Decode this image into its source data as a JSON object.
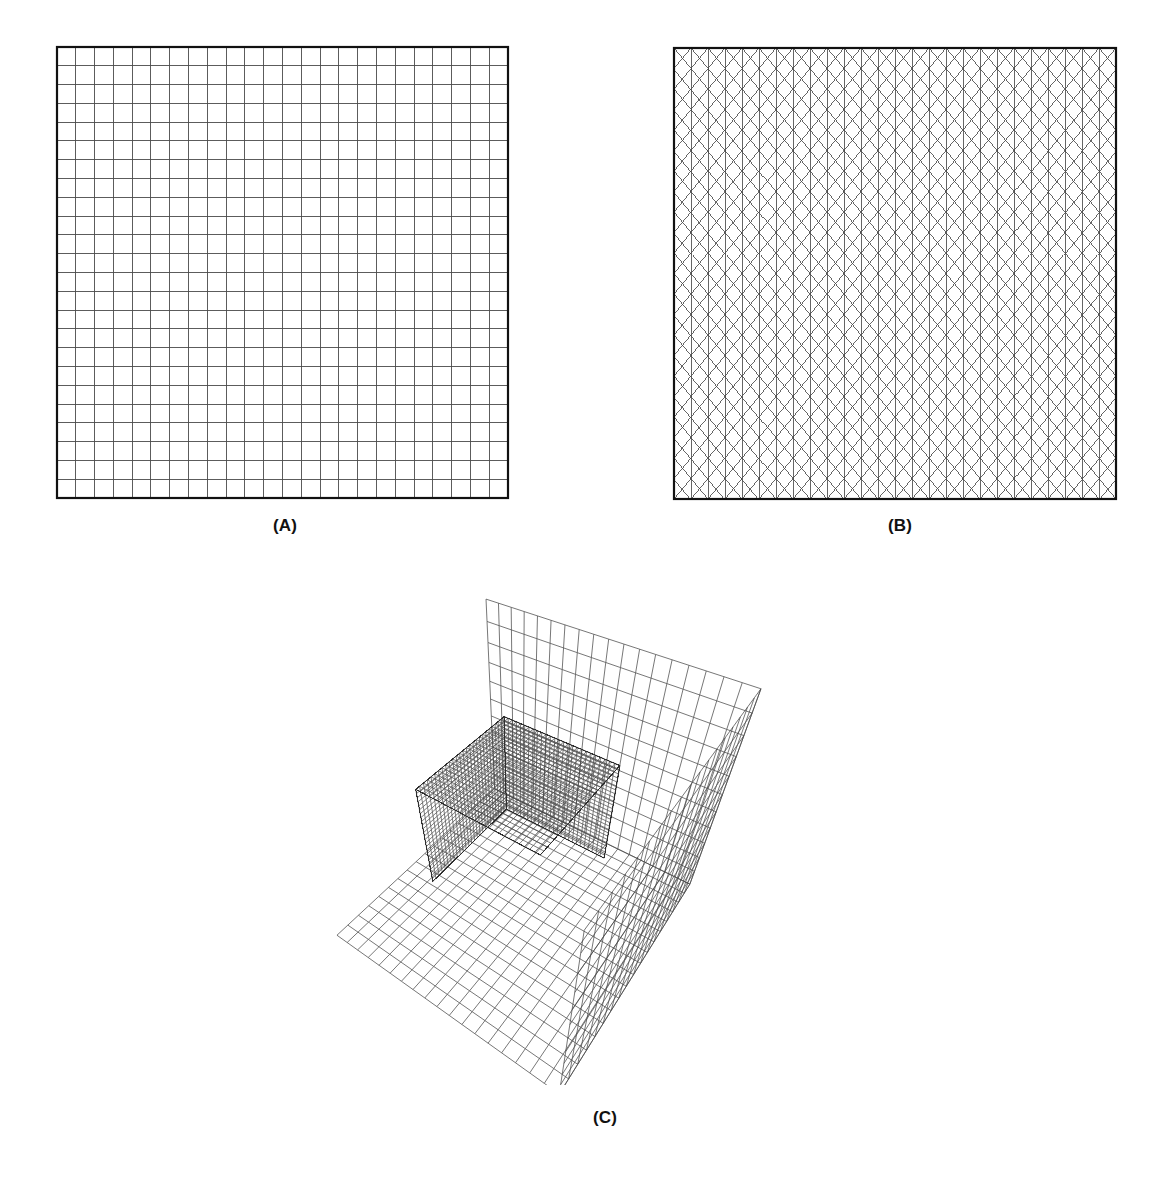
{
  "figure": {
    "background_color": "#ffffff",
    "line_color": "#4a4a4a",
    "border_color": "#111111",
    "caption_color": "#111111"
  },
  "panels": [
    {
      "id": "a",
      "caption": "(A)",
      "mesh_type": "structured-quadrilateral",
      "description": "Uniform structured quadrilateral (mapped) mesh on a square domain",
      "nx": 24,
      "ny": 24,
      "bounds": {
        "x": 55,
        "y": 45,
        "width": 455,
        "height": 455
      }
    },
    {
      "id": "b",
      "caption": "(B)",
      "mesh_type": "structured-triangular",
      "description": "Structured triangular mesh on a square domain formed by vertical lines and two crossing diagonal families",
      "nx": 26,
      "ny": 22,
      "bounds": {
        "x": 672,
        "y": 46,
        "width": 446,
        "height": 455
      }
    },
    {
      "id": "c",
      "caption": "(C)",
      "mesh_type": "hexahedral-3d",
      "description": "Three-dimensional hexahedral mesh: a finely meshed inner cube nested inside an outer box corner (back walls and floor)",
      "inner_divisions": 26,
      "outer_divisions": 18,
      "bounds": {
        "x": 180,
        "y": 580,
        "width": 680,
        "height": 505
      }
    }
  ],
  "chart_data": {
    "type": "diagram",
    "title": "",
    "subtitle": "",
    "panel_labels": [
      "(A)",
      "(B)",
      "(C)"
    ],
    "panel_descriptions": [
      "Quadrilateral structured mesh of a unit square, 24 x 24 cells",
      "Triangular structured mesh of a unit square",
      "Hexahedral three-dimensional mesh of a cube inside an enclosing box"
    ]
  }
}
